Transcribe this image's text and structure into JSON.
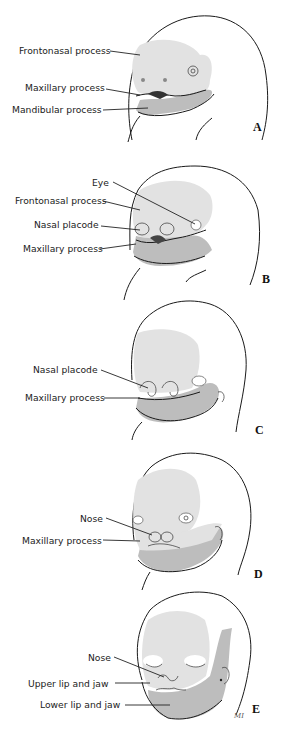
{
  "figure": {
    "colors": {
      "background": "#ffffff",
      "frontonasal_shade": "#e2e2e2",
      "maxillary_mandibular_shade": "#bdbdbd",
      "line": "#1a1a1a"
    },
    "panels": [
      {
        "letter": "A",
        "labels": [
          "Frontonasal process",
          "Maxillary process",
          "Mandibular process"
        ]
      },
      {
        "letter": "B",
        "labels": [
          "Eye",
          "Frontonasal process",
          "Nasal placode",
          "Maxillary process"
        ]
      },
      {
        "letter": "C",
        "labels": [
          "Nasal placode",
          "Maxillary process"
        ]
      },
      {
        "letter": "D",
        "labels": [
          "Nose",
          "Maxillary process"
        ]
      },
      {
        "letter": "E",
        "labels": [
          "Nose",
          "Upper lip and jaw",
          "Lower lip and jaw"
        ]
      }
    ],
    "signature": "MI"
  }
}
